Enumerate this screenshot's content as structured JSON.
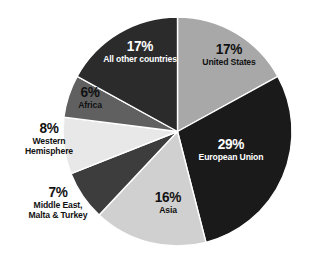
{
  "chart_data": {
    "type": "pie",
    "title": "",
    "subtitle": "",
    "xlabel": "",
    "ylabel": "",
    "legend": "none",
    "grid": false,
    "units": "percent",
    "background_color": "#ffffff",
    "start_angle_deg": 0,
    "direction": "clockwise",
    "categories": [
      "United States",
      "European Union",
      "Asia",
      "Middle East, Malta & Turkey",
      "Western Hemisphere",
      "Africa",
      "All other countries"
    ],
    "values": [
      17,
      29,
      16,
      7,
      8,
      6,
      17
    ],
    "slices": [
      {
        "label": "United States",
        "label_lines": [
          "United States"
        ],
        "percent": 17,
        "percent_text": "17%",
        "color": "#a8a8a8",
        "text_color": "#111111",
        "label_position": "inside"
      },
      {
        "label": "European Union",
        "label_lines": [
          "European Union"
        ],
        "percent": 29,
        "percent_text": "29%",
        "color": "#1a1a1a",
        "text_color": "#ffffff",
        "label_position": "inside"
      },
      {
        "label": "Asia",
        "label_lines": [
          "Asia"
        ],
        "percent": 16,
        "percent_text": "16%",
        "color": "#d0d0d0",
        "text_color": "#111111",
        "label_position": "inside"
      },
      {
        "label": "Middle East, Malta & Turkey",
        "label_lines": [
          "Middle East,",
          "Malta & Turkey"
        ],
        "percent": 7,
        "percent_text": "7%",
        "color": "#3d3d3d",
        "text_color": "#111111",
        "label_position": "outside-left"
      },
      {
        "label": "Western Hemisphere",
        "label_lines": [
          "Western",
          "Hemisphere"
        ],
        "percent": 8,
        "percent_text": "8%",
        "color": "#e8e8e8",
        "text_color": "#111111",
        "label_position": "outside-left"
      },
      {
        "label": "Africa",
        "label_lines": [
          "Africa"
        ],
        "percent": 6,
        "percent_text": "6%",
        "color": "#606060",
        "text_color": "#111111",
        "label_position": "inside"
      },
      {
        "label": "All other countries",
        "label_lines": [
          "All other countries"
        ],
        "percent": 17,
        "percent_text": "17%",
        "color": "#2b2b2b",
        "text_color": "#ffffff",
        "label_position": "inside"
      }
    ]
  },
  "labels": {
    "united_states": {
      "pct": "17%",
      "name": "United States"
    },
    "european_union": {
      "pct": "29%",
      "name": "European Union"
    },
    "asia": {
      "pct": "16%",
      "name": "Asia"
    },
    "all_other": {
      "pct": "17%",
      "name": "All other countries"
    },
    "africa": {
      "pct": "6%",
      "name": "Africa"
    },
    "western_hemisphere": {
      "pct": "8%",
      "name_line1": "Western",
      "name_line2": "Hemisphere"
    },
    "middle_east": {
      "pct": "7%",
      "name_line1": "Middle East,",
      "name_line2": "Malta & Turkey"
    }
  }
}
